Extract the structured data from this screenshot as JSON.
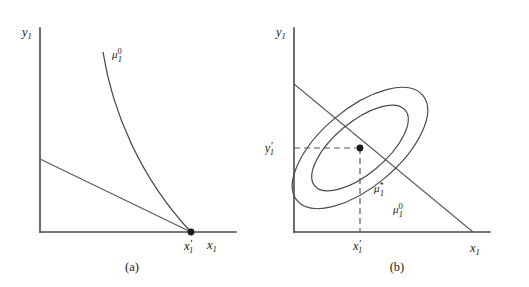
{
  "figure": {
    "width": 529,
    "height": 287,
    "background": "#ffffff",
    "ink_color": "#4a4a4a"
  },
  "panels": [
    {
      "id": "a",
      "caption": "(a)",
      "axes": {
        "y_label": "y",
        "y_label_sub": "1",
        "x_label": "x",
        "x_label_sub": "1",
        "origin": {
          "x": 40,
          "y": 232
        },
        "y_axis_top": 28,
        "x_axis_right": 236
      },
      "budget_line": {
        "from": {
          "x": 40,
          "y": 159
        },
        "to": {
          "x": 191,
          "y": 232
        }
      },
      "indifference_curve": {
        "label_base": "μ",
        "label_sub": "1",
        "label_sup": "0",
        "label_pos": {
          "x": 112,
          "y": 58
        },
        "from": {
          "x": 103,
          "y": 52
        },
        "to": {
          "x": 191,
          "y": 232
        }
      },
      "optimum_point": {
        "x": 191,
        "y": 232,
        "label_base": "x",
        "label_prime": "′",
        "label_sub": "1"
      }
    },
    {
      "id": "b",
      "caption": "(b)",
      "axes": {
        "y_label": "y",
        "y_label_sub": "1",
        "x_label": "x",
        "x_label_sub": "1",
        "origin": {
          "x": 29,
          "y": 232
        },
        "y_axis_top": 28,
        "x_axis_right": 225
      },
      "budget_line": {
        "from": {
          "x": 29,
          "y": 84
        },
        "to": {
          "x": 208,
          "y": 232
        }
      },
      "ellipses": [
        {
          "name": "outer",
          "label_base": "μ",
          "label_sub": "1",
          "label_sup": "0",
          "label_pos": {
            "x": 128,
            "y": 152
          },
          "center": {
            "x": 95,
            "y": 148
          },
          "rx": 82,
          "ry": 39,
          "rotation": -40
        },
        {
          "name": "inner",
          "label_base": "μ",
          "label_sub": "1",
          "label_sup": "*",
          "label_pos": {
            "x": 109,
            "y": 131
          },
          "center": {
            "x": 95,
            "y": 148
          },
          "rx": 59,
          "ry": 26,
          "rotation": -40
        }
      ],
      "optimum_point": {
        "x": 95,
        "y": 148,
        "x_label_base": "x",
        "x_label_prime": "′",
        "x_label_sub": "1",
        "y_label_base": "y",
        "y_label_prime": "′",
        "y_label_sub": "1"
      },
      "guide_lines": {
        "horizontal_from_x": 29,
        "vertical_to_y": 232
      }
    }
  ]
}
